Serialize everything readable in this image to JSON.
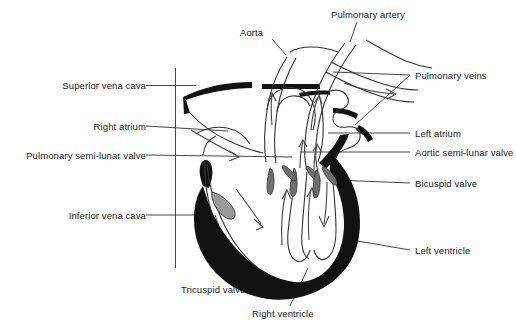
{
  "diagram": {
    "type": "anatomical-illustration",
    "background_color": "#ffffff",
    "ink_color": "#1a1a1a",
    "muscle_fill_color": "#111111",
    "valve_fill_color": "#9a9a9a",
    "labels": {
      "superior_vena_cava": "Superior vena cava",
      "right_atrium": "Right atrium",
      "pulmonary_semi_lunar_valve": "Pulmonary semi-lunar valve",
      "inferior_vena_cava": "Inferior vena cava",
      "tricuspid_valve": "Tricuspid valve",
      "right_ventricle": "Right ventricle",
      "aorta": "Aorta",
      "pulmonary_artery": "Pulmonary artery",
      "pulmonary_veins": "Pulmonary veins",
      "left_atrium": "Left atrium",
      "aortic_semi_lunar_valve": "Aortic semi-lunar valve",
      "bicuspid_valve": "Bicuspid valve",
      "left_ventricle": "Left ventricle"
    }
  }
}
